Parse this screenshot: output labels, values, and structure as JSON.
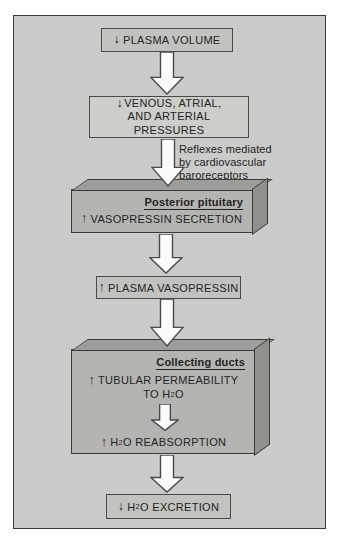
{
  "flow": {
    "plasma_volume": {
      "direction": "↓",
      "label": "PLASMA VOLUME"
    },
    "pressures": {
      "direction": "↓",
      "line1": "VENOUS, ATRIAL,",
      "line2": "AND ARTERIAL",
      "line3": "PRESSURES"
    },
    "reflex_note": {
      "line1": "Reflexes mediated",
      "line2": "by cardiovascular",
      "line3": "baroreceptors"
    },
    "posterior_pituitary": {
      "title": "Posterior pituitary",
      "direction": "↑",
      "label": "VASOPRESSIN SECRETION"
    },
    "plasma_vasopressin": {
      "direction": "↑",
      "label": "PLASMA VASOPRESSIN"
    },
    "collecting_ducts": {
      "title": "Collecting ducts",
      "permeability": {
        "direction": "↑",
        "line1": "TUBULAR PERMEABILITY",
        "line2_pre": "TO H",
        "line2_sub": "2",
        "line2_post": "O"
      },
      "reabsorption": {
        "direction": "↑",
        "pre": "H",
        "sub": "2",
        "post": "O REABSORPTION"
      }
    },
    "h2o_excretion": {
      "direction": "↓",
      "pre": "H",
      "sub": "2",
      "post": "O EXCRETION"
    }
  },
  "colors": {
    "panel_background": "#cbcbc9",
    "shaded_box_fill": "#c2c3bf",
    "light_box_fill": "#cdcdca",
    "front_face": "#b4b5b1",
    "top_face": "#9d9e9a",
    "side_face": "#90918b",
    "border": "#3a3a38",
    "arrow_fill": "#fbfbf9",
    "text": "#242424"
  }
}
